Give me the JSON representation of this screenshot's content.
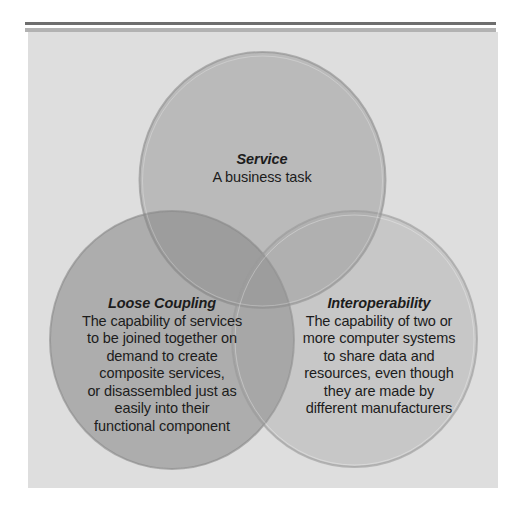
{
  "diagram": {
    "type": "venn",
    "colors": {
      "panel_background": "#dedede",
      "top_rule_dark": "#6e6e6e",
      "top_rule_light": "#b2b2b2",
      "service_fill": "#b3b3b3",
      "loose_coupling_fill": "#a8a8a8",
      "interoperability_fill": "#c6c6c6",
      "text": "#1c1c1c"
    },
    "circles": [
      {
        "id": "service",
        "title": "Service",
        "lines": [
          "A business task"
        ]
      },
      {
        "id": "loose_coupling",
        "title": "Loose Coupling",
        "lines": [
          "The capability of services",
          "to be joined together on",
          "demand to create",
          "composite services,",
          "or disassembled just as",
          "easily into their",
          "functional component"
        ]
      },
      {
        "id": "interoperability",
        "title": "Interoperability",
        "lines": [
          "The capability of two or",
          "more computer systems",
          "to share data and",
          "resources, even though",
          "they are made by",
          "different manufacturers"
        ]
      }
    ]
  }
}
